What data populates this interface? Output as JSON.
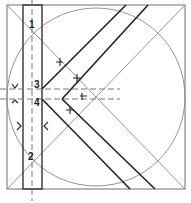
{
  "diagram": {
    "labels": [
      {
        "id": "1",
        "text": "1",
        "x": 29,
        "y": 28
      },
      {
        "id": "2",
        "text": "2",
        "x": 28,
        "y": 160
      },
      {
        "id": "3",
        "text": "3",
        "x": 34,
        "y": 88
      },
      {
        "id": "4",
        "text": "4",
        "x": 34,
        "y": 105
      }
    ],
    "colors": {
      "thin_line": "#888888",
      "thick_line": "#222222",
      "dashed_line": "#777777",
      "background": "#ffffff"
    }
  }
}
